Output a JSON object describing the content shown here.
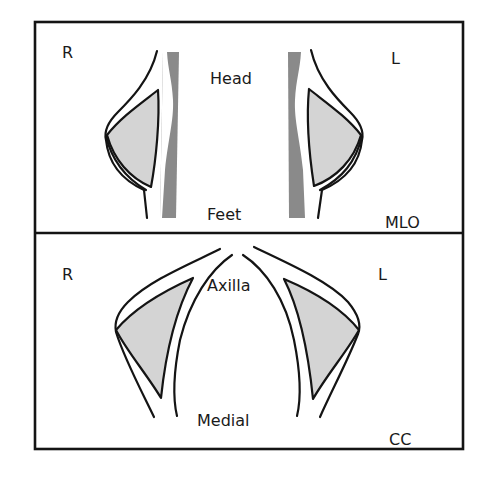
{
  "diagram": {
    "colors": {
      "outline": "#141414",
      "gland_fill": "#d4d4d4",
      "pectoral_fill": "#8a8a8a",
      "background": "#ffffff"
    },
    "frame": {
      "x": 35,
      "y": 22,
      "width": 428,
      "height": 427,
      "divider_y": 233
    },
    "mlo_panel": {
      "view_label": "MLO",
      "top_label": "Head",
      "bottom_label": "Feet",
      "right_side_label": "R",
      "left_side_label": "L"
    },
    "cc_panel": {
      "view_label": "CC",
      "top_label": "Axilla",
      "bottom_label": "Medial",
      "right_side_label": "R",
      "left_side_label": "L"
    }
  }
}
